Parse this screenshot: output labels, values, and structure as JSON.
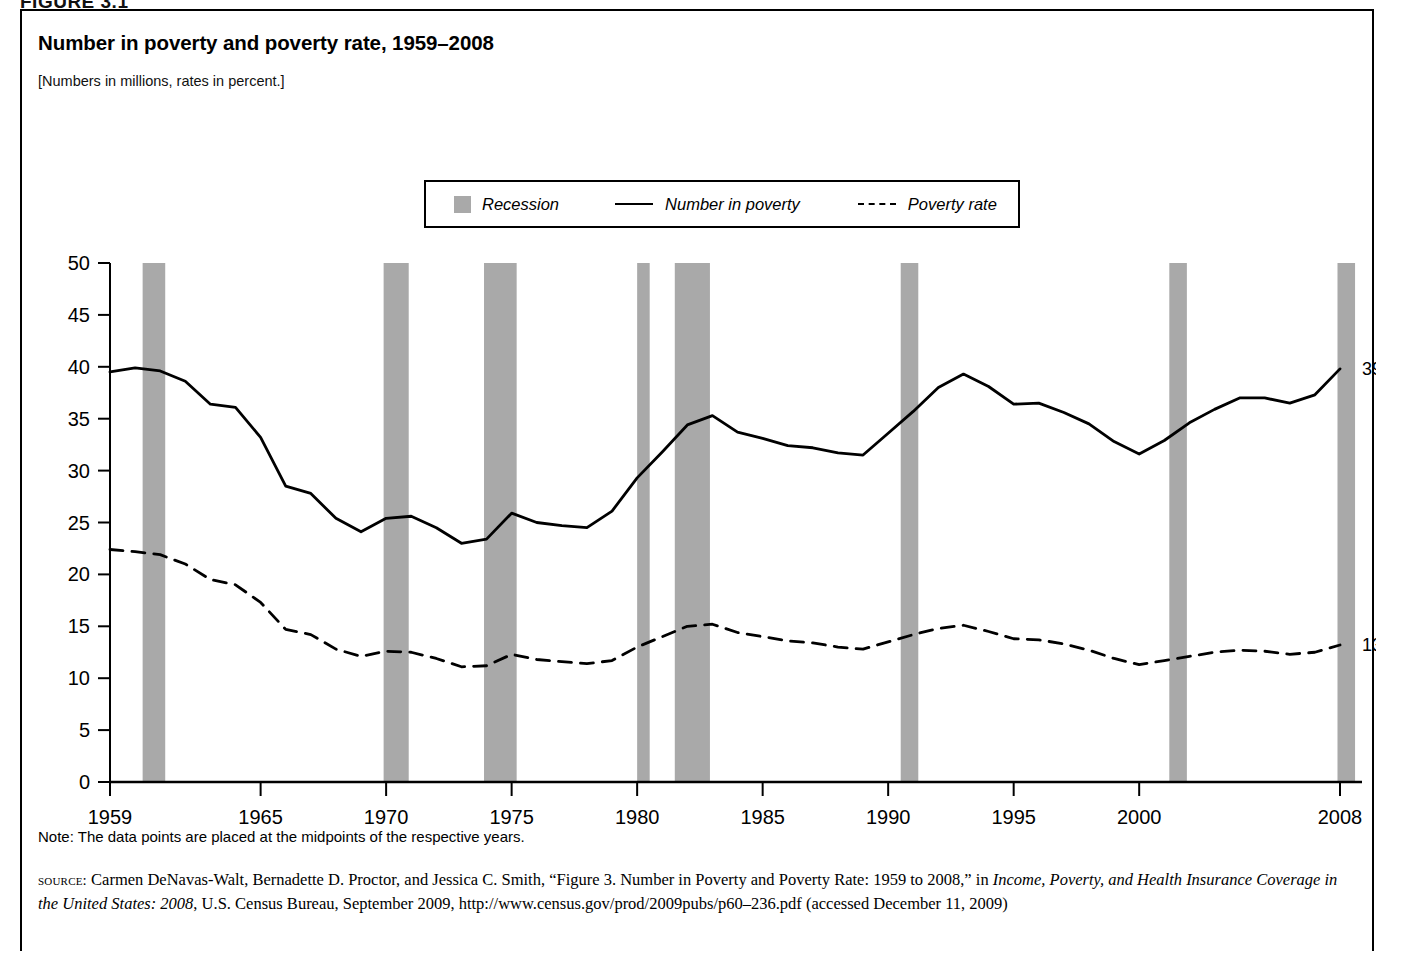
{
  "figure": {
    "label": "FIGURE 3.1"
  },
  "title": "Number in poverty and poverty rate, 1959–2008",
  "subtitle": "[Numbers in millions, rates in percent.]",
  "legend": {
    "recession": "Recession",
    "number_in_poverty": "Number in poverty",
    "poverty_rate": "Poverty rate"
  },
  "annotations": {
    "number_end": "39.8 million",
    "rate_end": "13.2 percent"
  },
  "note": "Note: The data points are placed at the midpoints of the respective years.",
  "source": {
    "kicker": "source:",
    "part1": " Carmen DeNavas-Walt, Bernadette D. Proctor, and Jessica C. Smith, “Figure 3. Number in Poverty and Poverty Rate: 1959 to 2008,” in ",
    "italic1": "Income, Poverty, and Health Insurance Coverage in the United States: 2008",
    "part2": ", U.S. Census Bureau, September 2009, http://www.census.gov/prod/2009pubs/p60–236.pdf (accessed December 11, 2009)"
  },
  "colors": {
    "recession_fill": "#a9a9a9",
    "line": "#000000",
    "frame": "#000000",
    "background": "#ffffff"
  },
  "chart_data": {
    "type": "line",
    "title": "Number in poverty and poverty rate, 1959–2008",
    "subtitle": "[Numbers in millions, rates in percent.]",
    "xlabel": "",
    "ylabel": "",
    "xlim": [
      1959,
      2008
    ],
    "ylim": [
      0,
      50
    ],
    "yticks": [
      0,
      5,
      10,
      15,
      20,
      25,
      30,
      35,
      40,
      45,
      50
    ],
    "xticks": [
      1959,
      1965,
      1970,
      1975,
      1980,
      1985,
      1990,
      1995,
      2000,
      2008
    ],
    "grid": false,
    "legend_position": "top-center",
    "x": [
      1959,
      1960,
      1961,
      1962,
      1963,
      1964,
      1965,
      1966,
      1967,
      1968,
      1969,
      1970,
      1971,
      1972,
      1973,
      1974,
      1975,
      1976,
      1977,
      1978,
      1979,
      1980,
      1981,
      1982,
      1983,
      1984,
      1985,
      1986,
      1987,
      1988,
      1989,
      1990,
      1991,
      1992,
      1993,
      1994,
      1995,
      1996,
      1997,
      1998,
      1999,
      2000,
      2001,
      2002,
      2003,
      2004,
      2005,
      2006,
      2007,
      2008
    ],
    "series": [
      {
        "name": "Number in poverty",
        "units": "millions",
        "style": "solid",
        "end_label": "39.8 million",
        "values": [
          39.5,
          39.9,
          39.6,
          38.6,
          36.4,
          36.1,
          33.2,
          28.5,
          27.8,
          25.4,
          24.1,
          25.4,
          25.6,
          24.5,
          23.0,
          23.4,
          25.9,
          25.0,
          24.7,
          24.5,
          26.1,
          29.3,
          31.8,
          34.4,
          35.3,
          33.7,
          33.1,
          32.4,
          32.2,
          31.7,
          31.5,
          33.6,
          35.7,
          38.0,
          39.3,
          38.1,
          36.4,
          36.5,
          35.6,
          34.5,
          32.8,
          31.6,
          32.9,
          34.6,
          35.9,
          37.0,
          37.0,
          36.5,
          37.3,
          39.8
        ]
      },
      {
        "name": "Poverty rate",
        "units": "percent",
        "style": "dashed",
        "end_label": "13.2 percent",
        "values": [
          22.4,
          22.2,
          21.9,
          21.0,
          19.5,
          19.0,
          17.3,
          14.7,
          14.2,
          12.8,
          12.1,
          12.6,
          12.5,
          11.9,
          11.1,
          11.2,
          12.3,
          11.8,
          11.6,
          11.4,
          11.7,
          13.0,
          14.0,
          15.0,
          15.2,
          14.4,
          14.0,
          13.6,
          13.4,
          13.0,
          12.8,
          13.5,
          14.2,
          14.8,
          15.1,
          14.5,
          13.8,
          13.7,
          13.3,
          12.7,
          11.9,
          11.3,
          11.7,
          12.1,
          12.5,
          12.7,
          12.6,
          12.3,
          12.5,
          13.2
        ]
      }
    ],
    "recessions": [
      {
        "start": 1960.3,
        "end": 1961.2
      },
      {
        "start": 1969.9,
        "end": 1970.9
      },
      {
        "start": 1973.9,
        "end": 1975.2
      },
      {
        "start": 1980.0,
        "end": 1980.5
      },
      {
        "start": 1981.5,
        "end": 1982.9
      },
      {
        "start": 1990.5,
        "end": 1991.2
      },
      {
        "start": 2001.2,
        "end": 2001.9
      },
      {
        "start": 2007.9,
        "end": 2008.6
      }
    ]
  }
}
